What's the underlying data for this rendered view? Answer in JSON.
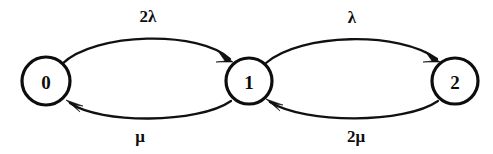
{
  "diagram": {
    "type": "state-transition-diagram",
    "title": "",
    "background_color": "#ffffff",
    "stroke_color": "#111111",
    "node_fill": "#ffffff",
    "states": [
      {
        "id": "0",
        "label": "0",
        "cx": 46,
        "cy": 81,
        "r": 24
      },
      {
        "id": "1",
        "label": "1",
        "cx": 249,
        "cy": 81,
        "r": 23
      },
      {
        "id": "2",
        "label": "2",
        "cx": 455,
        "cy": 81,
        "r": 23
      }
    ],
    "transitions": [
      {
        "id": "t0to1",
        "from": "0",
        "to": "1",
        "label": "2λ",
        "label_x": 148,
        "label_y": 18,
        "direction": "forward-upper"
      },
      {
        "id": "t1to0",
        "from": "1",
        "to": "0",
        "label": "μ",
        "label_x": 140,
        "label_y": 138,
        "direction": "backward-lower"
      },
      {
        "id": "t1to2",
        "from": "1",
        "to": "2",
        "label": "λ",
        "label_x": 352,
        "label_y": 19,
        "direction": "forward-upper"
      },
      {
        "id": "t2to1",
        "from": "2",
        "to": "1",
        "label": "2μ",
        "label_x": 356,
        "label_y": 138,
        "direction": "backward-lower"
      }
    ]
  }
}
